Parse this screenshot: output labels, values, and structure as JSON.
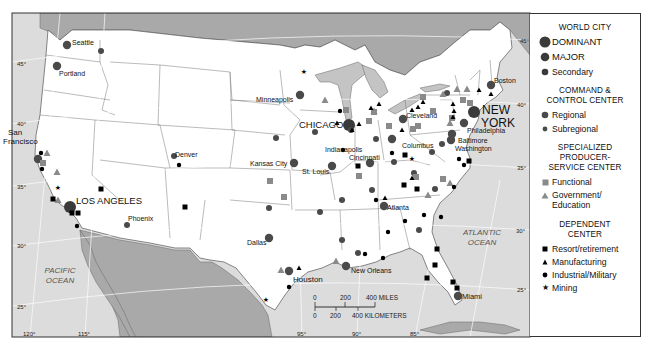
{
  "map": {
    "oceans": [
      {
        "label_lines": [
          "PACIFIC",
          "OCEAN"
        ],
        "x": 60,
        "y": 273
      },
      {
        "label_lines": [
          "ATLANTIC",
          "OCEAN"
        ],
        "x": 482,
        "y": 235
      }
    ],
    "latitude_labels": [
      {
        "text": "45°",
        "x": 17,
        "y": 66
      },
      {
        "text": "40°",
        "x": 17,
        "y": 126
      },
      {
        "text": "35°",
        "x": 17,
        "y": 189
      },
      {
        "text": "30°",
        "x": 17,
        "y": 248
      },
      {
        "text": "25°",
        "x": 17,
        "y": 309
      },
      {
        "text": "45°",
        "x": 520,
        "y": 43
      },
      {
        "text": "40°",
        "x": 517,
        "y": 107
      },
      {
        "text": "35°",
        "x": 517,
        "y": 170
      },
      {
        "text": "30°",
        "x": 516,
        "y": 233
      },
      {
        "text": "25°",
        "x": 517,
        "y": 292
      }
    ],
    "longitude_labels": [
      {
        "text": "120°",
        "x": 23,
        "y": 336
      },
      {
        "text": "115°",
        "x": 78,
        "y": 336
      },
      {
        "text": "95°",
        "x": 297,
        "y": 336
      },
      {
        "text": "90°",
        "x": 352,
        "y": 336
      },
      {
        "text": "85°",
        "x": 410,
        "y": 336
      }
    ],
    "scale_bar": {
      "miles_ticks": [
        "0",
        "200",
        "400 MILES"
      ],
      "km_ticks": [
        "0",
        "200",
        "400 KILOMETERS"
      ]
    },
    "city_labels": [
      {
        "text": "Seattle",
        "x": 72,
        "y": 45,
        "size": 7
      },
      {
        "text": "Portland",
        "x": 59,
        "y": 76,
        "size": 7
      },
      {
        "text": "San",
        "x": 8,
        "y": 135,
        "size": 8
      },
      {
        "text": "Francisco",
        "x": 3,
        "y": 144,
        "size": 8
      },
      {
        "text": "LOS ANGELES",
        "x": 76,
        "y": 204,
        "size": 9.5
      },
      {
        "text": "Phoenix",
        "x": 128,
        "y": 221,
        "size": 7
      },
      {
        "text": "Denver",
        "x": 175,
        "y": 157,
        "size": 7
      },
      {
        "text": "Minneapolis",
        "x": 256,
        "y": 102,
        "size": 7
      },
      {
        "text": "CHICAGO",
        "x": 299,
        "y": 128,
        "size": 9.5
      },
      {
        "text": "Kansas City",
        "x": 250,
        "y": 166,
        "size": 7
      },
      {
        "text": "St. Louis",
        "x": 302,
        "y": 174,
        "size": 7
      },
      {
        "text": "Indianapolis",
        "x": 325,
        "y": 152,
        "size": 7
      },
      {
        "text": "Cincinnati",
        "x": 349,
        "y": 160,
        "size": 7
      },
      {
        "text": "Dallas",
        "x": 247,
        "y": 245,
        "size": 7
      },
      {
        "text": "Houston",
        "x": 293,
        "y": 282,
        "size": 8
      },
      {
        "text": "New Orleans",
        "x": 351,
        "y": 273,
        "size": 7
      },
      {
        "text": "Atlanta",
        "x": 387,
        "y": 210,
        "size": 7
      },
      {
        "text": "Miami",
        "x": 462,
        "y": 299,
        "size": 7.5
      },
      {
        "text": "Columbus",
        "x": 402,
        "y": 148,
        "size": 7
      },
      {
        "text": "Cleveland",
        "x": 406,
        "y": 118,
        "size": 7
      },
      {
        "text": "Philadelphia",
        "x": 467,
        "y": 133,
        "size": 7
      },
      {
        "text": "Baltimore",
        "x": 458,
        "y": 143,
        "size": 7
      },
      {
        "text": "Washington",
        "x": 455,
        "y": 151,
        "size": 7
      },
      {
        "text": "Boston",
        "x": 494,
        "y": 83,
        "size": 7
      },
      {
        "text": "NEW",
        "x": 482,
        "y": 114,
        "size": 12
      },
      {
        "text": "YORK",
        "x": 481,
        "y": 127,
        "size": 12
      }
    ],
    "markers": [
      {
        "type": "major",
        "x": 67,
        "y": 45
      },
      {
        "type": "major",
        "x": 57,
        "y": 66
      },
      {
        "type": "regional",
        "x": 101,
        "y": 51
      },
      {
        "type": "major",
        "x": 38,
        "y": 159
      },
      {
        "type": "dominant",
        "x": 70,
        "y": 207
      },
      {
        "type": "regional",
        "x": 127,
        "y": 225
      },
      {
        "type": "regional",
        "x": 174,
        "y": 156
      },
      {
        "type": "major",
        "x": 300,
        "y": 95
      },
      {
        "type": "dominant",
        "x": 349,
        "y": 125
      },
      {
        "type": "major",
        "x": 294,
        "y": 163
      },
      {
        "type": "major",
        "x": 332,
        "y": 166
      },
      {
        "type": "major",
        "x": 269,
        "y": 238
      },
      {
        "type": "major",
        "x": 289,
        "y": 271
      },
      {
        "type": "major",
        "x": 346,
        "y": 266
      },
      {
        "type": "major",
        "x": 370,
        "y": 163
      },
      {
        "type": "major",
        "x": 384,
        "y": 206
      },
      {
        "type": "major",
        "x": 458,
        "y": 296
      },
      {
        "type": "dominant",
        "x": 474,
        "y": 112
      },
      {
        "type": "major",
        "x": 491,
        "y": 85
      },
      {
        "type": "major",
        "x": 464,
        "y": 123
      },
      {
        "type": "major",
        "x": 452,
        "y": 134
      },
      {
        "type": "major",
        "x": 451,
        "y": 140
      },
      {
        "type": "major",
        "x": 392,
        "y": 139
      },
      {
        "type": "major",
        "x": 403,
        "y": 119
      },
      {
        "type": "regional",
        "x": 432,
        "y": 152
      },
      {
        "type": "regional",
        "x": 276,
        "y": 138
      },
      {
        "type": "regional",
        "x": 269,
        "y": 208
      },
      {
        "type": "regional",
        "x": 320,
        "y": 212
      },
      {
        "type": "regional",
        "x": 342,
        "y": 240
      },
      {
        "type": "regional",
        "x": 342,
        "y": 200
      },
      {
        "type": "regional",
        "x": 372,
        "y": 190
      },
      {
        "type": "regional",
        "x": 358,
        "y": 253
      },
      {
        "type": "regional",
        "x": 419,
        "y": 230
      },
      {
        "type": "regional",
        "x": 435,
        "y": 189
      },
      {
        "type": "regional",
        "x": 442,
        "y": 144
      },
      {
        "type": "regional",
        "x": 376,
        "y": 139
      },
      {
        "type": "regional",
        "x": 351,
        "y": 130
      },
      {
        "type": "regional",
        "x": 394,
        "y": 162
      },
      {
        "type": "regional",
        "x": 447,
        "y": 93
      },
      {
        "type": "regional",
        "x": 315,
        "y": 132
      },
      {
        "type": "regional",
        "x": 414,
        "y": 173
      },
      {
        "type": "functional",
        "x": 43,
        "y": 163
      },
      {
        "type": "functional",
        "x": 270,
        "y": 181
      },
      {
        "type": "functional",
        "x": 284,
        "y": 197
      },
      {
        "type": "functional",
        "x": 346,
        "y": 110
      },
      {
        "type": "functional",
        "x": 374,
        "y": 112
      },
      {
        "type": "functional",
        "x": 423,
        "y": 97
      },
      {
        "type": "functional",
        "x": 463,
        "y": 100
      },
      {
        "type": "functional",
        "x": 470,
        "y": 103
      },
      {
        "type": "functional",
        "x": 452,
        "y": 118
      },
      {
        "type": "functional",
        "x": 369,
        "y": 121
      },
      {
        "type": "functional",
        "x": 389,
        "y": 126
      },
      {
        "type": "functional",
        "x": 413,
        "y": 129
      },
      {
        "type": "functional",
        "x": 433,
        "y": 111
      },
      {
        "type": "functional",
        "x": 416,
        "y": 177
      },
      {
        "type": "functional",
        "x": 443,
        "y": 179
      },
      {
        "type": "functional",
        "x": 359,
        "y": 176
      },
      {
        "type": "functional",
        "x": 418,
        "y": 126
      },
      {
        "type": "gov",
        "x": 47,
        "y": 153
      },
      {
        "type": "gov",
        "x": 57,
        "y": 172
      },
      {
        "type": "gov",
        "x": 58,
        "y": 200
      },
      {
        "type": "gov",
        "x": 325,
        "y": 100
      },
      {
        "type": "gov",
        "x": 281,
        "y": 270
      },
      {
        "type": "gov",
        "x": 336,
        "y": 261
      },
      {
        "type": "gov",
        "x": 428,
        "y": 195
      },
      {
        "type": "gov",
        "x": 450,
        "y": 183
      },
      {
        "type": "gov",
        "x": 374,
        "y": 111
      },
      {
        "type": "gov",
        "x": 443,
        "y": 94
      },
      {
        "type": "gov",
        "x": 457,
        "y": 89
      },
      {
        "type": "gov",
        "x": 467,
        "y": 89
      },
      {
        "type": "gov",
        "x": 450,
        "y": 123
      },
      {
        "type": "resort",
        "x": 53,
        "y": 199
      },
      {
        "type": "resort",
        "x": 101,
        "y": 189
      },
      {
        "type": "resort",
        "x": 72,
        "y": 213
      },
      {
        "type": "resort",
        "x": 78,
        "y": 213
      },
      {
        "type": "resort",
        "x": 185,
        "y": 207
      },
      {
        "type": "resort",
        "x": 358,
        "y": 166
      },
      {
        "type": "resort",
        "x": 404,
        "y": 185
      },
      {
        "type": "resort",
        "x": 417,
        "y": 189
      },
      {
        "type": "resort",
        "x": 405,
        "y": 155
      },
      {
        "type": "resort",
        "x": 469,
        "y": 161
      },
      {
        "type": "resort",
        "x": 437,
        "y": 249
      },
      {
        "type": "resort",
        "x": 435,
        "y": 265
      },
      {
        "type": "resort",
        "x": 427,
        "y": 278
      },
      {
        "type": "resort",
        "x": 453,
        "y": 282
      },
      {
        "type": "resort",
        "x": 457,
        "y": 288
      },
      {
        "type": "mfg",
        "x": 337,
        "y": 123
      },
      {
        "type": "mfg",
        "x": 359,
        "y": 124
      },
      {
        "type": "mfg",
        "x": 379,
        "y": 104
      },
      {
        "type": "mfg",
        "x": 371,
        "y": 108
      },
      {
        "type": "mfg",
        "x": 418,
        "y": 107
      },
      {
        "type": "mfg",
        "x": 412,
        "y": 110
      },
      {
        "type": "mfg",
        "x": 402,
        "y": 130
      },
      {
        "type": "mfg",
        "x": 423,
        "y": 102
      },
      {
        "type": "mfg",
        "x": 453,
        "y": 104
      },
      {
        "type": "mfg",
        "x": 454,
        "y": 111
      },
      {
        "type": "mfg",
        "x": 453,
        "y": 117
      },
      {
        "type": "mfg",
        "x": 352,
        "y": 130
      },
      {
        "type": "mfg",
        "x": 479,
        "y": 90
      },
      {
        "type": "mfg",
        "x": 491,
        "y": 94
      },
      {
        "type": "mfg",
        "x": 385,
        "y": 198
      },
      {
        "type": "mfg",
        "x": 299,
        "y": 268
      },
      {
        "type": "mfg",
        "x": 412,
        "y": 178
      },
      {
        "type": "ind",
        "x": 41,
        "y": 153
      },
      {
        "type": "ind",
        "x": 42,
        "y": 169
      },
      {
        "type": "ind",
        "x": 77,
        "y": 226
      },
      {
        "type": "ind",
        "x": 179,
        "y": 165
      },
      {
        "type": "ind",
        "x": 340,
        "y": 111
      },
      {
        "type": "ind",
        "x": 343,
        "y": 150
      },
      {
        "type": "ind",
        "x": 376,
        "y": 200
      },
      {
        "type": "ind",
        "x": 388,
        "y": 232
      },
      {
        "type": "ind",
        "x": 405,
        "y": 221
      },
      {
        "type": "ind",
        "x": 424,
        "y": 215
      },
      {
        "type": "ind",
        "x": 441,
        "y": 217
      },
      {
        "type": "ind",
        "x": 289,
        "y": 287
      },
      {
        "type": "ind",
        "x": 365,
        "y": 254
      },
      {
        "type": "ind",
        "x": 383,
        "y": 258
      },
      {
        "type": "ind",
        "x": 464,
        "y": 165
      },
      {
        "type": "ind",
        "x": 459,
        "y": 159
      },
      {
        "type": "ind",
        "x": 392,
        "y": 153
      },
      {
        "type": "ind",
        "x": 454,
        "y": 187
      },
      {
        "type": "mining",
        "x": 58,
        "y": 187
      },
      {
        "type": "mining",
        "x": 304,
        "y": 71
      },
      {
        "type": "mining",
        "x": 266,
        "y": 299
      },
      {
        "type": "mining",
        "x": 412,
        "y": 158
      }
    ]
  },
  "legend": {
    "world_city": {
      "title": "WORLD CITY",
      "items": [
        "DOMINANT",
        "MAJOR",
        "Secondary"
      ]
    },
    "command_control": {
      "title_lines": [
        "COMMAND &",
        "CONTROL CENTER"
      ],
      "items": [
        "Regional",
        "Subregional"
      ]
    },
    "specialized": {
      "title_lines": [
        "SPECIALIZED",
        "PRODUCER-",
        "SERVICE CENTER"
      ],
      "items": [
        "Functional",
        "Government/",
        "Education"
      ]
    },
    "dependent": {
      "title_lines": [
        "DEPENDENT",
        "CENTER"
      ],
      "items": [
        "Resort/retirement",
        "Manufacturing",
        "Industrial/Military",
        "Mining"
      ]
    }
  },
  "colors": {
    "city_marker": "#4a4a4a",
    "specialized_marker": "#8a8a8a",
    "dependent_marker": "#000000",
    "ocean": "#d9d9d9",
    "foreign_land": "#a8a8a8",
    "us_land": "#ffffff",
    "lakes": "#c4c4c4"
  }
}
